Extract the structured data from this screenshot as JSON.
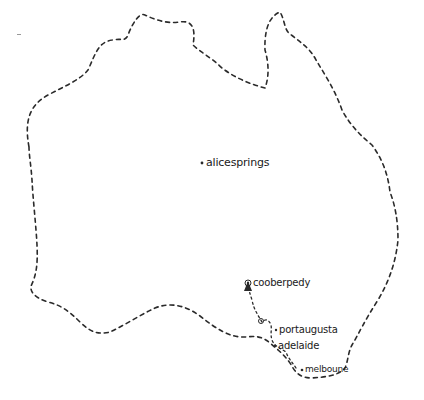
{
  "map": {
    "style": "hand-drawn dashed outline",
    "region": "Australia",
    "colors": {
      "ink": "#2a2a2a",
      "background": "#ffffff"
    }
  },
  "cities": [
    {
      "id": "alice-springs",
      "label": "alicesprings",
      "marker": "dot"
    },
    {
      "id": "coober-pedy",
      "label": "cooberpedy",
      "marker": "ringed-dot"
    },
    {
      "id": "port-augusta",
      "label": "portaugusta",
      "marker": "dot"
    },
    {
      "id": "adelaide",
      "label": "adelaide",
      "marker": "dot"
    },
    {
      "id": "melbourne",
      "label": "melboune",
      "marker": "dot"
    }
  ],
  "route": {
    "stops": [
      "melboune",
      "adelaide",
      "portaugusta",
      "cooberpedy"
    ],
    "arrow_at": "cooberpedy"
  }
}
